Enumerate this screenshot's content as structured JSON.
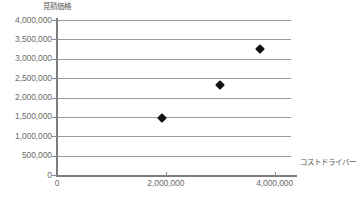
{
  "chart_data": {
    "type": "scatter",
    "title": "",
    "xlabel": "コストドライバー",
    "ylabel": "見積価格",
    "xlim": [
      0,
      4300000
    ],
    "ylim": [
      0,
      4000000
    ],
    "grid": true,
    "legend": "none",
    "x_ticks": [
      {
        "value": 0,
        "label": "0"
      },
      {
        "value": 2000000,
        "label": "2,000,000"
      },
      {
        "value": 4000000,
        "label": "4,000,000"
      }
    ],
    "y_ticks": [
      {
        "value": 4000000,
        "label": "4,000,000"
      },
      {
        "value": 3500000,
        "label": "3,500,000"
      },
      {
        "value": 3000000,
        "label": "3,000,000"
      },
      {
        "value": 2500000,
        "label": "2,500,000"
      },
      {
        "value": 2000000,
        "label": "2,000,000"
      },
      {
        "value": 1500000,
        "label": "1,500,000"
      },
      {
        "value": 1000000,
        "label": "1,000,000"
      },
      {
        "value": 500000,
        "label": "500,000"
      },
      {
        "value": 0,
        "label": "0"
      }
    ],
    "series": [
      {
        "name": "",
        "marker": "diamond",
        "color": "#121212",
        "points": [
          {
            "x": 1930000,
            "y": 1470000
          },
          {
            "x": 2990000,
            "y": 2320000
          },
          {
            "x": 3730000,
            "y": 3250000
          }
        ]
      }
    ]
  },
  "caption": ""
}
